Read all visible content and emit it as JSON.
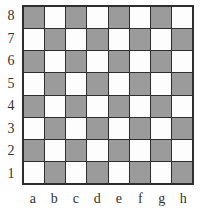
{
  "figure": {
    "name": "chessboard-diagram"
  },
  "board": {
    "files": [
      "a",
      "b",
      "c",
      "d",
      "e",
      "f",
      "g",
      "h"
    ],
    "ranks": [
      "8",
      "7",
      "6",
      "5",
      "4",
      "3",
      "2",
      "1"
    ],
    "colors": {
      "light_square": "#fdfdfd",
      "dark_square": "#9b9b9b",
      "grid_line": "#2e2e2e",
      "border": "#2e2e2e",
      "label_text": "#333333",
      "background": "#ffffff"
    },
    "size": {
      "files": 8,
      "ranks": 8
    },
    "corner_squares": {
      "a8": "dark",
      "h8": "light",
      "a1": "light",
      "h1": "dark"
    },
    "squares": [
      [
        "dark",
        "light",
        "dark",
        "light",
        "dark",
        "light",
        "dark",
        "light"
      ],
      [
        "light",
        "dark",
        "light",
        "dark",
        "light",
        "dark",
        "light",
        "dark"
      ],
      [
        "dark",
        "light",
        "dark",
        "light",
        "dark",
        "light",
        "dark",
        "light"
      ],
      [
        "light",
        "dark",
        "light",
        "dark",
        "light",
        "dark",
        "light",
        "dark"
      ],
      [
        "dark",
        "light",
        "dark",
        "light",
        "dark",
        "light",
        "dark",
        "light"
      ],
      [
        "light",
        "dark",
        "light",
        "dark",
        "light",
        "dark",
        "light",
        "dark"
      ],
      [
        "dark",
        "light",
        "dark",
        "light",
        "dark",
        "light",
        "dark",
        "light"
      ],
      [
        "light",
        "dark",
        "light",
        "dark",
        "light",
        "dark",
        "light",
        "dark"
      ]
    ]
  }
}
